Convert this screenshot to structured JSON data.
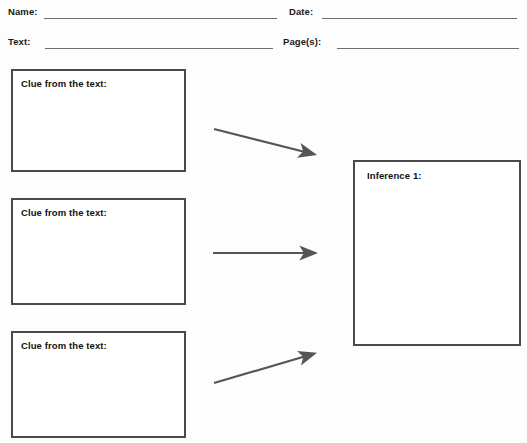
{
  "worksheet": {
    "title": "Making Inferences Graphic Organizer",
    "header": {
      "fields": [
        {
          "label": "Name:",
          "value": ""
        },
        {
          "label": "Date:",
          "value": ""
        },
        {
          "label": "Text:",
          "value": ""
        },
        {
          "label": "Page(s):",
          "value": ""
        }
      ]
    },
    "clue_boxes": [
      {
        "label": "Clue from the text:",
        "value": ""
      },
      {
        "label": "Clue from the text:",
        "value": ""
      },
      {
        "label": "Clue from the text:",
        "value": ""
      }
    ],
    "inference_boxes": [
      {
        "label": "Inference 1:",
        "value": ""
      }
    ],
    "arrows": [
      {
        "name": "arrow-clue-1-to-inference",
        "direction": "down-right"
      },
      {
        "name": "arrow-clue-2-to-inference",
        "direction": "right"
      },
      {
        "name": "arrow-clue-3-to-inference",
        "direction": "up-right"
      }
    ],
    "colors": {
      "page_background": "#fdfdfd",
      "box_border": "#4a4a4a",
      "rule_line": "#6e6e6e",
      "arrow": "#555555",
      "text": "#111111"
    }
  }
}
